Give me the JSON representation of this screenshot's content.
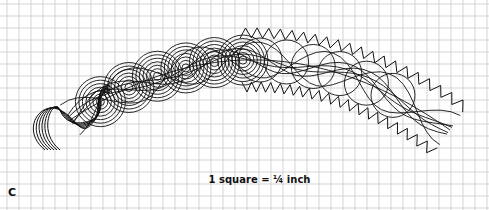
{
  "figure": {
    "panel_label": "C",
    "scale_note": "1 square = ¼ inch",
    "grid": {
      "spacing_px": 12,
      "line_color": "#c8c8c8",
      "background": "#ffffff"
    },
    "pattern_color": "#111111"
  }
}
